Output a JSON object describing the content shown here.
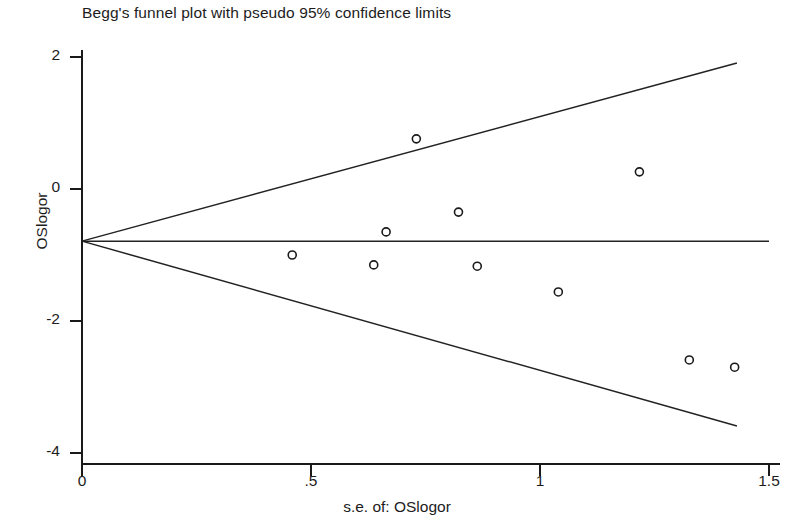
{
  "chart_data": {
    "type": "scatter",
    "title": "Begg's funnel plot with pseudo 95% confidence limits",
    "subtitle": "",
    "xlabel": "s.e. of: OSlogor",
    "ylabel": "OSlogor",
    "xlim": [
      0,
      1.5
    ],
    "ylim": [
      -4,
      2
    ],
    "xticks": [
      0,
      0.5,
      1,
      1.5
    ],
    "xticklabels": [
      "0",
      ".5",
      "1",
      "1.5"
    ],
    "yticks": [
      2,
      0,
      -2,
      -4
    ],
    "yticklabels": [
      "2",
      "0",
      "-2",
      "-4"
    ],
    "grid": false,
    "legend": null,
    "pooled_effect": -0.79,
    "ci_multiplier": 1.96,
    "marker": "open-circle",
    "marker_radius_px": 4,
    "series": [
      {
        "name": "studies",
        "x": [
          0.459,
          0.637,
          0.664,
          0.73,
          0.822,
          0.863,
          1.04,
          1.217,
          1.326,
          1.425,
          0.64
        ],
        "y": [
          -1.0,
          -1.15,
          -0.65,
          0.76,
          -0.35,
          -1.17,
          -1.56,
          0.26,
          -2.59,
          -2.7,
          -0.65
        ]
      }
    ],
    "points": [
      {
        "x": 0.459,
        "y": -1.0
      },
      {
        "x": 0.637,
        "y": -1.15
      },
      {
        "x": 0.664,
        "y": -0.65
      },
      {
        "x": 0.73,
        "y": 0.76
      },
      {
        "x": 0.822,
        "y": -0.35
      },
      {
        "x": 0.863,
        "y": -1.17
      },
      {
        "x": 1.04,
        "y": -1.56
      },
      {
        "x": 1.217,
        "y": 0.26
      },
      {
        "x": 1.326,
        "y": -2.59
      },
      {
        "x": 1.425,
        "y": -2.7
      }
    ],
    "lines": [
      {
        "name": "pseudo-95-upper",
        "from": {
          "x": 0,
          "y": -0.79
        },
        "to": {
          "x": 1.43,
          "y": 1.91
        }
      },
      {
        "name": "pseudo-95-lower",
        "from": {
          "x": 0,
          "y": -0.79
        },
        "to": {
          "x": 1.43,
          "y": -3.59
        }
      },
      {
        "name": "pooled-effect",
        "from": {
          "x": 0,
          "y": -0.79
        },
        "to": {
          "x": 1.5,
          "y": -0.79
        }
      }
    ],
    "colors": {
      "axis": "#1a1a1a",
      "line": "#222222",
      "marker_stroke": "#1a1a1a",
      "background": "#ffffff"
    }
  },
  "axis": {
    "y_label": "OSlogor",
    "x_label": "s.e. of: OSlogor",
    "y_tick_labels": [
      "2",
      "0",
      "-2",
      "-4"
    ],
    "x_tick_labels": [
      "0",
      ".5",
      "1",
      "1.5"
    ]
  },
  "header": {
    "title": "Begg's funnel plot with pseudo 95% confidence limits"
  }
}
